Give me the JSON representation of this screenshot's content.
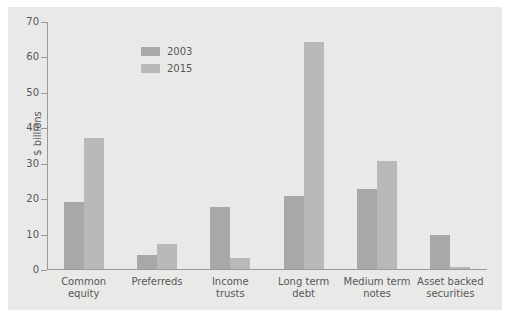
{
  "chart_data": {
    "type": "bar",
    "title": "",
    "xlabel": "",
    "ylabel": "$ billions",
    "ylim": [
      0,
      70
    ],
    "yticks": [
      0,
      10,
      20,
      30,
      40,
      50,
      60,
      70
    ],
    "grid": false,
    "legend_position": "top-left",
    "categories": [
      "Common equity",
      "Preferreds",
      "Income trusts",
      "Long term debt",
      "Medium term notes",
      "Asset backed securities"
    ],
    "category_lines": [
      [
        "Common",
        "equity"
      ],
      [
        "Preferreds",
        ""
      ],
      [
        "Income",
        "trusts"
      ],
      [
        "Long term",
        "debt"
      ],
      [
        "Medium term",
        "notes"
      ],
      [
        "Asset backed",
        "securities"
      ]
    ],
    "series": [
      {
        "name": "2003",
        "color": "#a8a8a6",
        "values": [
          19,
          4,
          17.5,
          20.5,
          22.5,
          9.5
        ]
      },
      {
        "name": "2015",
        "color": "#b9b9b7",
        "values": [
          37,
          7,
          3,
          64,
          30.5,
          0.7
        ]
      }
    ]
  },
  "colors": {
    "page_background": "#ffffff",
    "panel_background": "#e9e9e7",
    "axis": "#9a9a98",
    "text": "#58585a"
  }
}
